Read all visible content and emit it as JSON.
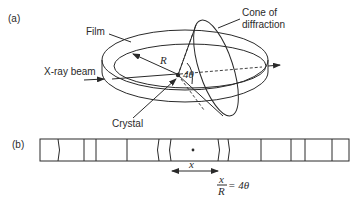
{
  "figure": {
    "panel_a": {
      "label": "(a)",
      "film_label": "Film",
      "beam_label": "X-ray beam",
      "radius_label": "R",
      "angle_label": "4θ",
      "crystal_label": "Crystal",
      "cone_label_line1": "Cone of",
      "cone_label_line2": "diffraction"
    },
    "panel_b": {
      "label": "(b)",
      "distance_label": "x",
      "formula_num": "x",
      "formula_den": "R",
      "formula_rhs": "= 4θ",
      "line_positions": [
        59,
        84,
        96,
        127,
        157,
        169,
        217,
        229,
        261,
        291,
        305,
        332
      ],
      "curved_lines": [
        59,
        157,
        169,
        217,
        229
      ]
    }
  }
}
